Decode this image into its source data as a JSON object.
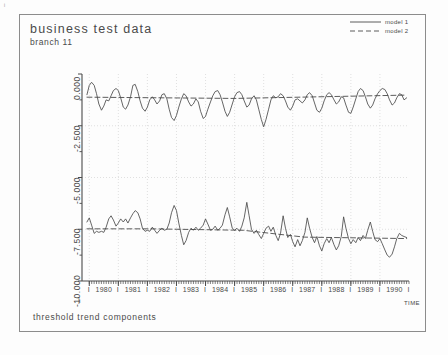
{
  "figure": {
    "corner_mark": "i",
    "title": "business test data",
    "subtitle": "branch 11",
    "caption": "threshold trend components",
    "time_axis_label": "TIME",
    "border_color": "#8c8c8c",
    "ink_color": "#4a4a4a",
    "grid_color": "#d8d8d8",
    "background": "#fdfdfd"
  },
  "legend": {
    "position": "top-right",
    "entries": [
      {
        "label": "model 1",
        "style": "solid"
      },
      {
        "label": "model 2",
        "style": "dashed"
      }
    ]
  },
  "chart_data": {
    "type": "line",
    "title": "business test data",
    "subtitle": "branch 11",
    "annotation": "threshold trend components",
    "xlabel": "TIME",
    "ylabel": "",
    "xlim": [
      1979.75,
      1991.0
    ],
    "ylim": [
      -10.0,
      0.0
    ],
    "grid": true,
    "legend_position": "top-right",
    "yticks": [
      0.0,
      -2.5,
      -5.0,
      -7.5,
      -10.0
    ],
    "ytick_labels": [
      "0.000",
      "-2.500",
      "-5.000",
      "-7.500",
      "-10.000"
    ],
    "yminor_ticks": [
      -1.25,
      -3.75,
      -6.25,
      -8.75
    ],
    "xticks": [
      1980,
      1981,
      1982,
      1983,
      1984,
      1985,
      1986,
      1987,
      1988,
      1989,
      1990
    ],
    "xtick_labels": [
      "1980",
      "1981",
      "1982",
      "1983",
      "1984",
      "1985",
      "1986",
      "1987",
      "1988",
      "1989",
      "1990"
    ],
    "xtick_separator": "I",
    "x_minor_interval_months": 1,
    "series": [
      {
        "name": "model 1 (upper component)",
        "style": "solid",
        "panel": "upper",
        "x": [
          1979.92,
          1980.0,
          1980.08,
          1980.17,
          1980.25,
          1980.33,
          1980.42,
          1980.5,
          1980.58,
          1980.67,
          1980.75,
          1980.83,
          1980.92,
          1981.0,
          1981.08,
          1981.17,
          1981.25,
          1981.33,
          1981.42,
          1981.5,
          1981.58,
          1981.67,
          1981.75,
          1981.83,
          1981.92,
          1982.0,
          1982.08,
          1982.17,
          1982.25,
          1982.33,
          1982.42,
          1982.5,
          1982.58,
          1982.67,
          1982.75,
          1982.83,
          1982.92,
          1983.0,
          1983.08,
          1983.17,
          1983.25,
          1983.33,
          1983.42,
          1983.5,
          1983.58,
          1983.67,
          1983.75,
          1983.83,
          1983.92,
          1984.0,
          1984.08,
          1984.17,
          1984.25,
          1984.33,
          1984.42,
          1984.5,
          1984.58,
          1984.67,
          1984.75,
          1984.83,
          1984.92,
          1985.0,
          1985.08,
          1985.17,
          1985.25,
          1985.33,
          1985.42,
          1985.5,
          1985.58,
          1985.67,
          1985.75,
          1985.83,
          1985.92,
          1986.0,
          1986.08,
          1986.17,
          1986.25,
          1986.33,
          1986.42,
          1986.5,
          1986.58,
          1986.67,
          1986.75,
          1986.83,
          1986.92,
          1987.0,
          1987.08,
          1987.17,
          1987.25,
          1987.33,
          1987.42,
          1987.5,
          1987.58,
          1987.67,
          1987.75,
          1987.83,
          1987.92,
          1988.0,
          1988.08,
          1988.17,
          1988.25,
          1988.33,
          1988.42,
          1988.5,
          1988.58,
          1988.67,
          1988.75,
          1988.83,
          1988.92,
          1989.0,
          1989.08,
          1989.17,
          1989.25,
          1989.33,
          1989.42,
          1989.5,
          1989.58,
          1989.67,
          1989.75,
          1989.83,
          1989.92,
          1990.0,
          1990.08,
          1990.17,
          1990.25,
          1990.33,
          1990.42,
          1990.5,
          1990.58,
          1990.67,
          1990.75,
          1990.83,
          1990.92
        ],
        "y": [
          -1.0,
          -0.55,
          -0.4,
          -0.55,
          -0.95,
          -1.45,
          -1.75,
          -1.55,
          -1.25,
          -1.3,
          -1.05,
          -0.8,
          -0.7,
          -0.8,
          -1.15,
          -1.6,
          -1.7,
          -1.5,
          -1.1,
          -0.55,
          -0.5,
          -0.85,
          -1.3,
          -1.65,
          -1.8,
          -1.6,
          -1.25,
          -1.1,
          -1.25,
          -1.45,
          -1.3,
          -1.0,
          -0.95,
          -1.2,
          -1.7,
          -2.1,
          -2.25,
          -2.0,
          -1.6,
          -1.2,
          -0.95,
          -1.05,
          -1.35,
          -1.55,
          -1.45,
          -1.2,
          -1.35,
          -1.8,
          -2.15,
          -2.05,
          -1.7,
          -1.35,
          -1.05,
          -0.85,
          -0.8,
          -1.0,
          -1.35,
          -1.8,
          -2.05,
          -1.85,
          -1.45,
          -1.1,
          -0.9,
          -0.85,
          -1.0,
          -1.3,
          -1.6,
          -1.5,
          -1.2,
          -1.05,
          -1.25,
          -1.7,
          -2.2,
          -2.55,
          -2.2,
          -1.7,
          -1.25,
          -1.05,
          -1.15,
          -1.1,
          -0.95,
          -1.05,
          -1.3,
          -1.6,
          -1.75,
          -1.55,
          -1.25,
          -1.2,
          -1.3,
          -1.4,
          -1.25,
          -1.0,
          -0.9,
          -1.05,
          -1.4,
          -1.75,
          -1.85,
          -1.65,
          -1.3,
          -1.0,
          -0.9,
          -1.0,
          -1.25,
          -1.45,
          -1.35,
          -1.1,
          -1.15,
          -1.5,
          -1.85,
          -1.9,
          -1.6,
          -1.2,
          -0.85,
          -0.7,
          -0.8,
          -1.1,
          -1.45,
          -1.65,
          -1.5,
          -1.2,
          -0.95,
          -0.8,
          -0.7,
          -0.75,
          -0.95,
          -1.25,
          -1.5,
          -1.4,
          -1.15,
          -0.95,
          -1.0,
          -1.25,
          -1.15
        ]
      },
      {
        "name": "model 2 (upper trend)",
        "style": "dashed",
        "panel": "upper",
        "x": [
          1979.92,
          1985.0,
          1990.92
        ],
        "y": [
          -1.12,
          -1.18,
          -1.02
        ]
      },
      {
        "name": "model 1 (lower component)",
        "style": "solid",
        "panel": "lower",
        "x": [
          1979.92,
          1980.0,
          1980.08,
          1980.17,
          1980.25,
          1980.33,
          1980.42,
          1980.5,
          1980.58,
          1980.67,
          1980.75,
          1980.83,
          1980.92,
          1981.0,
          1981.08,
          1981.17,
          1981.25,
          1981.33,
          1981.42,
          1981.5,
          1981.58,
          1981.67,
          1981.75,
          1981.83,
          1981.92,
          1982.0,
          1982.08,
          1982.17,
          1982.25,
          1982.33,
          1982.42,
          1982.5,
          1982.58,
          1982.67,
          1982.75,
          1982.83,
          1982.92,
          1983.0,
          1983.08,
          1983.17,
          1983.25,
          1983.33,
          1983.42,
          1983.5,
          1983.58,
          1983.67,
          1983.75,
          1983.83,
          1983.92,
          1984.0,
          1984.08,
          1984.17,
          1984.25,
          1984.33,
          1984.42,
          1984.5,
          1984.58,
          1984.67,
          1984.75,
          1984.83,
          1984.92,
          1985.0,
          1985.08,
          1985.17,
          1985.25,
          1985.33,
          1985.42,
          1985.5,
          1985.58,
          1985.67,
          1985.75,
          1985.83,
          1985.92,
          1986.0,
          1986.08,
          1986.17,
          1986.25,
          1986.33,
          1986.42,
          1986.5,
          1986.58,
          1986.67,
          1986.75,
          1986.83,
          1986.92,
          1987.0,
          1987.08,
          1987.17,
          1987.25,
          1987.33,
          1987.42,
          1987.5,
          1987.58,
          1987.67,
          1987.75,
          1987.83,
          1987.92,
          1988.0,
          1988.08,
          1988.17,
          1988.25,
          1988.33,
          1988.42,
          1988.5,
          1988.58,
          1988.67,
          1988.75,
          1988.83,
          1988.92,
          1989.0,
          1989.08,
          1989.17,
          1989.25,
          1989.33,
          1989.42,
          1989.5,
          1989.58,
          1989.67,
          1989.75,
          1989.83,
          1989.92,
          1990.0,
          1990.08,
          1990.17,
          1990.25,
          1990.33,
          1990.42,
          1990.5,
          1990.58,
          1990.67,
          1990.75,
          1990.83,
          1990.92
        ],
        "y": [
          -7.15,
          -6.95,
          -7.3,
          -7.7,
          -7.6,
          -7.65,
          -7.6,
          -7.65,
          -7.4,
          -7.0,
          -6.85,
          -7.05,
          -7.35,
          -7.2,
          -7.0,
          -7.15,
          -7.0,
          -7.2,
          -6.95,
          -6.75,
          -6.6,
          -6.7,
          -7.0,
          -7.45,
          -7.6,
          -7.55,
          -7.6,
          -7.4,
          -7.55,
          -7.7,
          -7.55,
          -7.45,
          -7.55,
          -7.5,
          -7.2,
          -6.7,
          -6.35,
          -6.6,
          -7.2,
          -7.8,
          -8.25,
          -8.05,
          -7.65,
          -7.45,
          -7.55,
          -7.4,
          -7.55,
          -7.45,
          -7.3,
          -7.0,
          -7.25,
          -7.55,
          -7.5,
          -7.35,
          -7.55,
          -7.45,
          -7.3,
          -6.8,
          -6.45,
          -6.9,
          -7.45,
          -7.55,
          -7.45,
          -7.6,
          -7.35,
          -6.95,
          -6.2,
          -6.85,
          -7.5,
          -7.7,
          -7.55,
          -7.75,
          -7.95,
          -7.7,
          -7.45,
          -7.35,
          -7.6,
          -7.4,
          -7.8,
          -8.05,
          -7.7,
          -6.85,
          -7.45,
          -7.9,
          -7.75,
          -8.1,
          -8.35,
          -8.0,
          -8.3,
          -8.05,
          -7.65,
          -6.95,
          -7.45,
          -7.9,
          -8.15,
          -7.85,
          -8.3,
          -8.55,
          -8.2,
          -7.95,
          -8.15,
          -7.9,
          -8.25,
          -8.5,
          -8.3,
          -7.85,
          -6.9,
          -7.45,
          -7.95,
          -8.2,
          -8.0,
          -8.15,
          -7.9,
          -8.05,
          -7.8,
          -7.95,
          -7.55,
          -7.15,
          -7.6,
          -8.0,
          -8.1,
          -7.95,
          -8.2,
          -8.5,
          -8.75,
          -8.85,
          -8.7,
          -8.35,
          -7.95,
          -7.7,
          -7.8,
          -7.85,
          -7.9
        ]
      },
      {
        "name": "model 2 (lower trend)",
        "style": "dashed",
        "panel": "lower",
        "x": [
          1979.92,
          1982.1,
          1982.1,
          1985.3,
          1985.3,
          1987.4,
          1987.4,
          1990.92
        ],
        "y": [
          -7.48,
          -7.48,
          -7.48,
          -7.55,
          -7.55,
          -7.88,
          -7.88,
          -7.95
        ]
      }
    ]
  }
}
